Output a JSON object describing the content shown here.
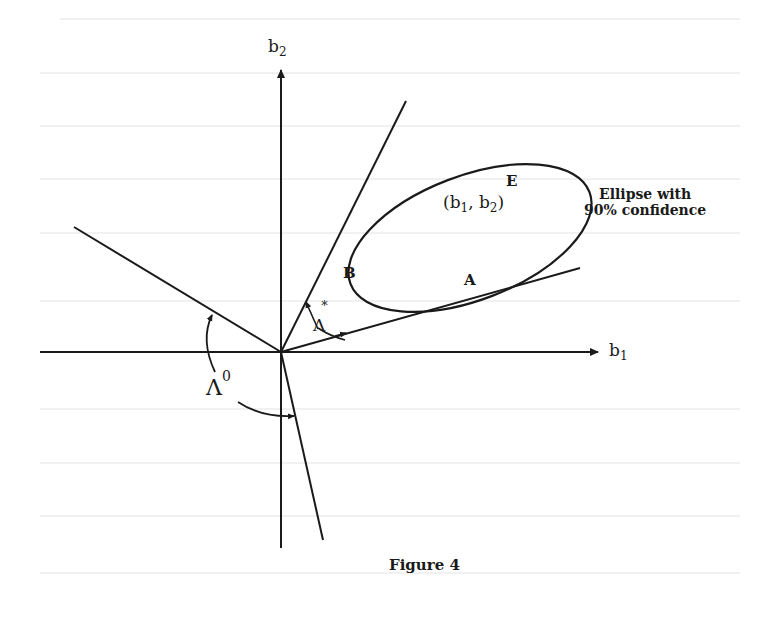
{
  "figure": {
    "caption": "Figure 4",
    "axes": {
      "x_label_base": "b",
      "x_label_sub": "1",
      "y_label_base": "b",
      "y_label_sub": "2"
    },
    "ellipse": {
      "label": "E",
      "center_label_open": "(b",
      "center_label_sub1": "1",
      "center_label_mid": ", b",
      "center_label_sub2": "2",
      "center_label_close": ")",
      "annotation_line1": "Ellipse with",
      "annotation_line2": "90% confidence"
    },
    "tangent_points": {
      "upper": "B",
      "lower": "A"
    },
    "angles": {
      "inner_symbol": "Λ",
      "inner_superscript": "*",
      "outer_symbol": "Λ",
      "outer_superscript": "0"
    },
    "colors": {
      "ink": "#1a1a1a",
      "background": "#ffffff",
      "bleed_through": "#f1f1f1"
    }
  }
}
